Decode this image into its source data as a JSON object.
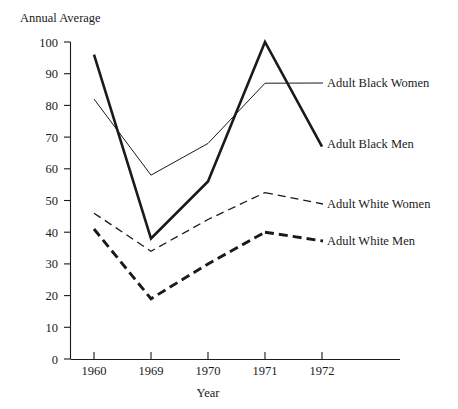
{
  "chart_data": {
    "type": "line",
    "title": "",
    "ylabel": "Annual Average",
    "xlabel": "Year",
    "categories": [
      "1960",
      "1969",
      "1970",
      "1971",
      "1972"
    ],
    "x": [
      1960,
      1969,
      1970,
      1971,
      1972
    ],
    "ylim": [
      0,
      100
    ],
    "xlim": [
      0,
      4
    ],
    "grid": false,
    "legend_position": "right-inline-labels",
    "y_ticks": [
      0,
      10,
      20,
      30,
      40,
      50,
      60,
      70,
      80,
      90,
      100
    ],
    "y_tick_labels": [
      "0",
      "10",
      "20",
      "30",
      "40",
      "50",
      "60",
      "70",
      "80",
      "90",
      "100"
    ],
    "series": [
      {
        "name": "Adult Black Men",
        "label": "Adult Black Men",
        "style": "solid-thick",
        "color": "#1a1a1a",
        "values": [
          96,
          38,
          56,
          100,
          67
        ]
      },
      {
        "name": "Adult Black Women",
        "label": "Adult Black Women",
        "style": "solid-thin",
        "color": "#1a1a1a",
        "values": [
          82,
          58,
          68,
          87,
          87
        ]
      },
      {
        "name": "Adult White Women",
        "label": "Adult White Women",
        "style": "dashed-thin",
        "color": "#1a1a1a",
        "values": [
          46,
          34,
          44,
          52.5,
          50
        ]
      },
      {
        "name": "Adult White Men",
        "label": "Adult White Men",
        "style": "dashed-thick",
        "color": "#1a1a1a",
        "values": [
          41,
          19,
          30,
          40,
          37
        ]
      }
    ]
  },
  "labels": {
    "y_axis_title": "Annual Average",
    "x_axis_title": "Year",
    "black_women": "Adult Black Women",
    "black_men": "Adult Black Men",
    "white_women": "Adult White Women",
    "white_men": "Adult White Men"
  },
  "ticks": {
    "y": [
      "100",
      "90",
      "80",
      "70",
      "60",
      "50",
      "40",
      "30",
      "20",
      "10",
      "0"
    ],
    "x": [
      "1960",
      "1969",
      "1970",
      "1971",
      "1972"
    ]
  }
}
